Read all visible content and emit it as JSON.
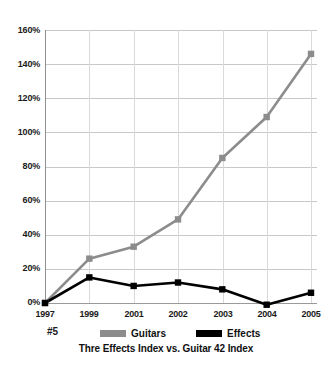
{
  "chart_data": {
    "type": "line",
    "title": "Thre Effects Index vs. Guitar 42 Index",
    "corner_label": "#5",
    "xlabel": "",
    "ylabel": "",
    "x": [
      "1997",
      "1999",
      "2001",
      "2002",
      "2003",
      "2004",
      "2005"
    ],
    "categories": [
      "1997",
      "1999",
      "2001",
      "2002",
      "2003",
      "2004",
      "2005"
    ],
    "series": [
      {
        "name": "Guitars",
        "color": "#8c8c8c",
        "marker": "square",
        "values": [
          0,
          26,
          33,
          49,
          85,
          109,
          146
        ]
      },
      {
        "name": "Effects",
        "color": "#000000",
        "marker": "square",
        "values": [
          0,
          15,
          10,
          12,
          8,
          -1,
          6
        ]
      }
    ],
    "ylim": [
      0,
      160
    ],
    "ytick_values": [
      0,
      20,
      40,
      60,
      80,
      100,
      120,
      140,
      160
    ],
    "ytick_labels": [
      "0%",
      "20%",
      "40%",
      "60%",
      "80%",
      "100%",
      "120%",
      "140%",
      "160%"
    ],
    "grid": "horizontal",
    "legend_position": "bottom"
  },
  "axes": {
    "y_labels": [
      "160%",
      "140%",
      "120%",
      "100%",
      "80%",
      "60%",
      "40%",
      "20%",
      "0%"
    ],
    "x_labels": [
      "1997",
      "1999",
      "2001",
      "2002",
      "2003",
      "2004",
      "2005"
    ]
  },
  "legend": {
    "guitars_label": "Guitars",
    "effects_label": "Effects",
    "guitars_color": "#8c8c8c",
    "effects_color": "#000000"
  },
  "footer": {
    "corner_label": "#5",
    "caption": "Thre Effects Index vs. Guitar 42 Index"
  }
}
